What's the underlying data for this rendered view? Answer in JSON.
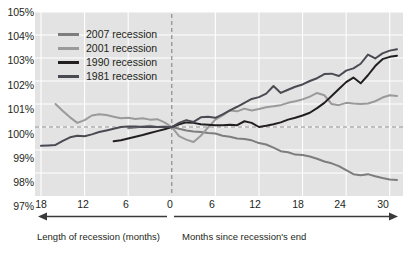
{
  "chart_data": {
    "type": "line",
    "title": "",
    "subtitle": "",
    "xlabel_left": "Length of recession (months)",
    "xlabel_right": "Months since recession's end",
    "ylabel": "",
    "ylim": [
      97,
      105
    ],
    "yticks": [
      "97%",
      "98%",
      "99%",
      "100%",
      "101%",
      "102%",
      "103%",
      "104%",
      "105%"
    ],
    "ytick_values": [
      97,
      98,
      99,
      100,
      101,
      102,
      103,
      104,
      105
    ],
    "xlim": [
      -18,
      31
    ],
    "xticks": [
      "18",
      "12",
      "6",
      "0",
      "6",
      "12",
      "18",
      "24",
      "30"
    ],
    "xtick_values": [
      -18,
      -12,
      -6,
      0,
      6,
      12,
      18,
      24,
      30
    ],
    "grid": true,
    "reference_lines": [
      {
        "name": "baseline-100",
        "axis": "y",
        "value": 100,
        "style": "dashed"
      },
      {
        "name": "recession-end",
        "axis": "x",
        "value": 0,
        "style": "dashed"
      }
    ],
    "legend_position": "top-left",
    "series": [
      {
        "name": "2007 recession",
        "color": "#7d7d7d",
        "width": 2.0,
        "points": [
          [
            -6,
            99.95
          ],
          [
            -5,
            99.98
          ],
          [
            -4,
            100.02
          ],
          [
            -3,
            100.05
          ],
          [
            -2,
            100.0
          ],
          [
            -1,
            100.02
          ],
          [
            0,
            100.0
          ],
          [
            1,
            99.92
          ],
          [
            2,
            99.85
          ],
          [
            3,
            99.8
          ],
          [
            4,
            99.78
          ],
          [
            5,
            99.74
          ],
          [
            6,
            99.72
          ],
          [
            7,
            99.62
          ],
          [
            8,
            99.58
          ],
          [
            9,
            99.5
          ],
          [
            10,
            99.48
          ],
          [
            11,
            99.42
          ],
          [
            12,
            99.3
          ],
          [
            13,
            99.24
          ],
          [
            14,
            99.1
          ],
          [
            15,
            98.95
          ],
          [
            16,
            98.9
          ],
          [
            17,
            98.8
          ],
          [
            18,
            98.78
          ],
          [
            19,
            98.72
          ],
          [
            20,
            98.62
          ],
          [
            21,
            98.5
          ],
          [
            22,
            98.42
          ],
          [
            23,
            98.3
          ],
          [
            24,
            98.12
          ],
          [
            25,
            97.95
          ],
          [
            26,
            97.9
          ],
          [
            27,
            97.95
          ],
          [
            28,
            97.86
          ],
          [
            29,
            97.78
          ],
          [
            30,
            97.72
          ],
          [
            31,
            97.7
          ]
        ]
      },
      {
        "name": "2001 recession",
        "color": "#9a9a9a",
        "width": 2.0,
        "points": [
          [
            -16,
            101.0
          ],
          [
            -15,
            100.7
          ],
          [
            -14,
            100.42
          ],
          [
            -13,
            100.18
          ],
          [
            -12,
            100.3
          ],
          [
            -11,
            100.5
          ],
          [
            -10,
            100.55
          ],
          [
            -9,
            100.52
          ],
          [
            -8,
            100.45
          ],
          [
            -7,
            100.38
          ],
          [
            -6,
            100.4
          ],
          [
            -5,
            100.35
          ],
          [
            -4,
            100.38
          ],
          [
            -3,
            100.32
          ],
          [
            -2,
            100.34
          ],
          [
            -1,
            100.2
          ],
          [
            0,
            100.0
          ],
          [
            1,
            99.6
          ],
          [
            2,
            99.45
          ],
          [
            3,
            99.35
          ],
          [
            4,
            99.62
          ],
          [
            5,
            99.98
          ],
          [
            6,
            100.32
          ],
          [
            7,
            100.5
          ],
          [
            8,
            100.72
          ],
          [
            9,
            100.68
          ],
          [
            10,
            100.8
          ],
          [
            11,
            100.72
          ],
          [
            12,
            100.78
          ],
          [
            13,
            100.86
          ],
          [
            14,
            100.9
          ],
          [
            15,
            100.95
          ],
          [
            16,
            101.05
          ],
          [
            17,
            101.12
          ],
          [
            18,
            101.2
          ],
          [
            19,
            101.32
          ],
          [
            20,
            101.48
          ],
          [
            21,
            101.38
          ],
          [
            22,
            101.0
          ],
          [
            23,
            100.95
          ],
          [
            24,
            101.05
          ],
          [
            25,
            101.02
          ],
          [
            26,
            101.0
          ],
          [
            27,
            101.02
          ],
          [
            28,
            101.12
          ],
          [
            29,
            101.28
          ],
          [
            30,
            101.38
          ],
          [
            31,
            101.35
          ]
        ]
      },
      {
        "name": "1990 recession",
        "color": "#231f20",
        "width": 2.0,
        "points": [
          [
            -8,
            99.38
          ],
          [
            -7,
            99.42
          ],
          [
            -6,
            99.5
          ],
          [
            -5,
            99.58
          ],
          [
            -4,
            99.65
          ],
          [
            -3,
            99.74
          ],
          [
            -2,
            99.82
          ],
          [
            -1,
            99.9
          ],
          [
            0,
            100.0
          ],
          [
            1,
            100.12
          ],
          [
            2,
            100.2
          ],
          [
            3,
            100.18
          ],
          [
            4,
            100.12
          ],
          [
            5,
            100.1
          ],
          [
            6,
            100.08
          ],
          [
            7,
            100.08
          ],
          [
            8,
            100.1
          ],
          [
            9,
            100.08
          ],
          [
            10,
            100.25
          ],
          [
            11,
            100.18
          ],
          [
            12,
            100.0
          ],
          [
            13,
            100.05
          ],
          [
            14,
            100.12
          ],
          [
            15,
            100.2
          ],
          [
            16,
            100.32
          ],
          [
            17,
            100.4
          ],
          [
            18,
            100.5
          ],
          [
            19,
            100.62
          ],
          [
            20,
            100.82
          ],
          [
            21,
            101.05
          ],
          [
            22,
            101.35
          ],
          [
            23,
            101.65
          ],
          [
            24,
            101.95
          ],
          [
            25,
            102.15
          ],
          [
            26,
            101.9
          ],
          [
            27,
            102.25
          ],
          [
            28,
            102.65
          ],
          [
            29,
            102.95
          ],
          [
            30,
            103.05
          ],
          [
            31,
            103.1
          ]
        ]
      },
      {
        "name": "1981 recession",
        "color": "#4a4a52",
        "width": 2.0,
        "points": [
          [
            -18,
            99.18
          ],
          [
            -17,
            99.2
          ],
          [
            -16,
            99.22
          ],
          [
            -15,
            99.4
          ],
          [
            -14,
            99.55
          ],
          [
            -13,
            99.62
          ],
          [
            -12,
            99.6
          ],
          [
            -11,
            99.68
          ],
          [
            -10,
            99.78
          ],
          [
            -9,
            99.85
          ],
          [
            -8,
            99.92
          ],
          [
            -7,
            100.0
          ],
          [
            -6,
            100.02
          ],
          [
            -5,
            100.02
          ],
          [
            -4,
            100.0
          ],
          [
            -3,
            100.0
          ],
          [
            -2,
            100.0
          ],
          [
            -1,
            100.0
          ],
          [
            0,
            100.0
          ],
          [
            1,
            100.18
          ],
          [
            2,
            100.3
          ],
          [
            3,
            100.22
          ],
          [
            4,
            100.42
          ],
          [
            5,
            100.45
          ],
          [
            6,
            100.4
          ],
          [
            7,
            100.55
          ],
          [
            8,
            100.72
          ],
          [
            9,
            100.88
          ],
          [
            10,
            101.05
          ],
          [
            11,
            101.22
          ],
          [
            12,
            101.3
          ],
          [
            13,
            101.45
          ],
          [
            14,
            101.78
          ],
          [
            15,
            101.48
          ],
          [
            16,
            101.62
          ],
          [
            17,
            101.75
          ],
          [
            18,
            101.85
          ],
          [
            19,
            102.0
          ],
          [
            20,
            102.12
          ],
          [
            21,
            102.3
          ],
          [
            22,
            102.32
          ],
          [
            23,
            102.22
          ],
          [
            24,
            102.45
          ],
          [
            25,
            102.55
          ],
          [
            26,
            102.75
          ],
          [
            27,
            103.15
          ],
          [
            28,
            102.98
          ],
          [
            29,
            103.2
          ],
          [
            30,
            103.32
          ],
          [
            31,
            103.38
          ]
        ]
      }
    ]
  },
  "legend": {
    "items": [
      {
        "label": "2007 recession",
        "color": "#7d7d7d"
      },
      {
        "label": "2001 recession",
        "color": "#9a9a9a"
      },
      {
        "label": "1990 recession",
        "color": "#231f20"
      },
      {
        "label": "1981 recession",
        "color": "#4a4a52"
      }
    ]
  },
  "axes": {
    "y_labels": [
      "105%",
      "104%",
      "103%",
      "102%",
      "101%",
      "100%",
      "99%",
      "98%",
      "97%"
    ],
    "x_labels": [
      "18",
      "12",
      "6",
      "0",
      "6",
      "12",
      "18",
      "24",
      "30"
    ],
    "caption_left": "Length of recession (months)",
    "caption_right": "Months since recession's end"
  },
  "colors": {
    "plot_background": "#e3e3e3",
    "grid": "#ffffff",
    "text": "#231f20",
    "dashed_reference": "#8c8c8c"
  }
}
